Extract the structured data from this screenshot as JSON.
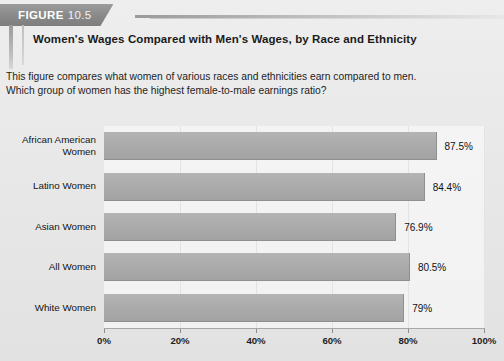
{
  "banner": {
    "label": "FIGURE",
    "number": "10.5"
  },
  "title": "Women's Wages Compared with Men's Wages, by Race and Ethnicity",
  "description": {
    "line1": "This figure compares what women of various races and ethnicities earn compared to men.",
    "line2": "Which group of women has the highest female-to-male earnings ratio?"
  },
  "colors": {
    "bar_fill": "#ababab",
    "bar_edge": "#8f8f8f",
    "plot_bg": "#f3f3f3",
    "page_bg": "#e8e8e8",
    "banner_bg": "#8a8a8a",
    "text": "#141414"
  },
  "chart_data": {
    "type": "bar",
    "orientation": "horizontal",
    "title": "Women's Wages Compared with Men's Wages, by Race and Ethnicity",
    "xlabel": "",
    "ylabel": "",
    "categories": [
      "African American Women",
      "Latino Women",
      "Asian Women",
      "All Women",
      "White Women"
    ],
    "category_lines": [
      [
        "African American",
        "Women"
      ],
      [
        "Latino Women"
      ],
      [
        "Asian Women"
      ],
      [
        "All Women"
      ],
      [
        "White Women"
      ]
    ],
    "values": [
      87.5,
      84.4,
      76.9,
      80.5,
      79
    ],
    "value_labels": [
      "87.5%",
      "84.4%",
      "76.9%",
      "80.5%",
      "79%"
    ],
    "xlim": [
      0,
      100
    ],
    "xticks": [
      0,
      20,
      40,
      60,
      80,
      100
    ],
    "xtick_labels": [
      "0%",
      "20%",
      "40%",
      "60%",
      "80%",
      "100%"
    ],
    "grid": true,
    "legend": false
  }
}
